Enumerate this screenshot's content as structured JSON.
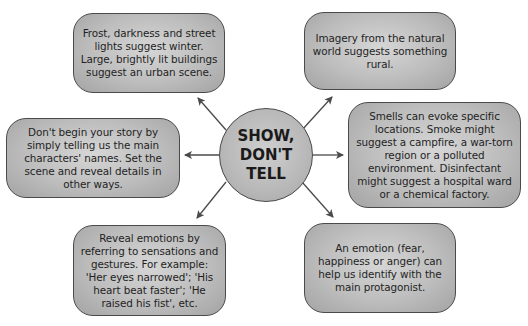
{
  "center": {
    "label_line1": "SHOW,",
    "label_line2": "DON'T",
    "label_line3": "TELL"
  },
  "boxes": [
    {
      "id": "top-left",
      "text": "Frost, darkness and street lights suggest winter. Large, brightly lit buildings suggest an urban scene."
    },
    {
      "id": "top-right",
      "text": "Imagery from the natural world suggests something rural."
    },
    {
      "id": "left",
      "text": "Don't begin your story by simply telling us the main characters' names. Set the scene and reveal details in other ways."
    },
    {
      "id": "right",
      "text": "Smells can evoke specific locations. Smoke might suggest a campfire, a war-torn region or a polluted environment. Disinfectant might suggest a hospital ward or a chemical factory."
    },
    {
      "id": "bottom-left",
      "text": "Reveal emotions by referring to sensations and gestures. For example: 'Her eyes narrowed'; 'His heart beat faster'; 'He raised his fist', etc."
    },
    {
      "id": "bottom-right",
      "text": "An emotion (fear, happiness or anger) can help us identify with the main protagonist."
    }
  ],
  "colors": {
    "box_fill": "#bdbdbd",
    "border": "#4a4a4a",
    "arrow": "#4a4a4a",
    "text": "#1f1f1f"
  }
}
